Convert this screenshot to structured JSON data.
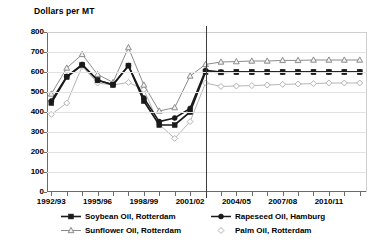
{
  "chart_data": {
    "type": "line",
    "title": "",
    "ylabel": "Dollars per MT",
    "xlabel": "",
    "ylim": [
      0,
      800
    ],
    "ytick_values": [
      0,
      100,
      200,
      300,
      400,
      500,
      600,
      700,
      800
    ],
    "ytick_labels": [
      "0",
      "100",
      "200",
      "300",
      "400",
      "500",
      "600",
      "700",
      "800"
    ],
    "grid": true,
    "legend_position": "bottom",
    "x": [
      "1992/93",
      "1993/94",
      "1994/95",
      "1995/96",
      "1996/97",
      "1997/98",
      "1998/99",
      "1999/00",
      "2000/01",
      "2001/02",
      "2002/03",
      "2003/04",
      "2004/05",
      "2005/06",
      "2006/07",
      "2007/08",
      "2008/09",
      "2009/10",
      "2010/11",
      "2011/12",
      "2012/13"
    ],
    "xtick_labels": [
      "1992/93",
      "1995/96",
      "1998/99",
      "2001/02",
      "2004/05",
      "2007/08",
      "2010/11"
    ],
    "xtick_label_indices": [
      0,
      3,
      6,
      9,
      12,
      15,
      18
    ],
    "annotations": [
      {
        "type": "vline",
        "x_index": 10,
        "label": ""
      }
    ],
    "series": [
      {
        "name": "Soybean Oil, Rotterdam",
        "marker": "filled-square",
        "color": "#1a1a1a",
        "values": [
          445,
          575,
          635,
          560,
          535,
          632,
          455,
          335,
          335,
          400,
          600,
          598,
          600,
          600,
          600,
          600,
          600,
          600,
          600,
          600,
          600
        ]
      },
      {
        "name": "Rapeseed Oil, Hamburg",
        "marker": "filled-circle",
        "color": "#1a1a1a",
        "values": [
          455,
          578,
          638,
          558,
          538,
          632,
          470,
          352,
          370,
          418,
          608,
          600,
          600,
          600,
          600,
          600,
          600,
          600,
          600,
          600,
          600
        ]
      },
      {
        "name": "Sunflower Oil, Rotterdam",
        "marker": "open-triangle",
        "color": "#8c8c8c",
        "values": [
          490,
          620,
          688,
          588,
          548,
          722,
          535,
          405,
          422,
          580,
          638,
          650,
          652,
          655,
          655,
          658,
          658,
          660,
          660,
          660,
          660
        ]
      },
      {
        "name": "Palm Oil, Rotterdam",
        "marker": "open-diamond",
        "color": "#b5b5b5",
        "values": [
          388,
          445,
          628,
          545,
          535,
          548,
          512,
          338,
          268,
          352,
          545,
          528,
          530,
          532,
          535,
          538,
          540,
          542,
          545,
          545,
          545
        ]
      }
    ]
  },
  "legend": {
    "items": [
      {
        "label": "Soybean Oil, Rotterdam"
      },
      {
        "label": "Rapeseed Oil, Hamburg"
      },
      {
        "label": "Sunflower Oil, Rotterdam"
      },
      {
        "label": "Palm Oil, Rotterdam"
      }
    ]
  }
}
